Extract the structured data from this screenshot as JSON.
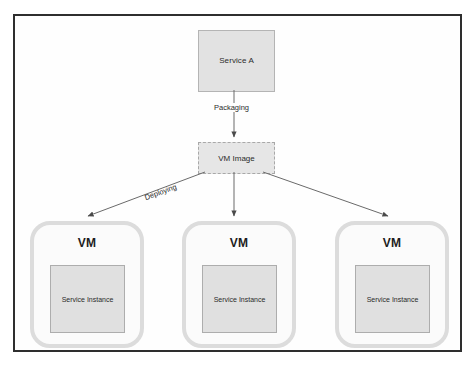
{
  "diagram": {
    "frame": {
      "border_color": "#2e2e2e",
      "background_color": "#fefefe"
    },
    "nodes": {
      "service_a": {
        "label": "Service A",
        "shape": "rectangle",
        "fill": "#e2e2e2",
        "border": "#b4b4b4",
        "border_style": "solid"
      },
      "vm_image": {
        "label": "VM Image",
        "shape": "rectangle",
        "fill": "#e6e6e6",
        "border": "#a8a8a8",
        "border_style": "dashed"
      }
    },
    "vms": [
      {
        "title": "VM",
        "instance_label": "Service Instance"
      },
      {
        "title": "VM",
        "instance_label": "Service Instance"
      },
      {
        "title": "VM",
        "instance_label": "Service Instance"
      }
    ],
    "edges": {
      "packaging": {
        "label": "Packaging",
        "from": "Service A",
        "to": "VM Image"
      },
      "deploying": {
        "label": "Deploying",
        "from": "VM Image",
        "to": "VM"
      }
    },
    "colors": {
      "vm_border": "#dcdcdc",
      "vm_fill": "#fbfbfb",
      "instance_fill": "#e0e0e0",
      "instance_border": "#adadad",
      "arrow": "#555555",
      "text": "#2b2b2b"
    }
  }
}
